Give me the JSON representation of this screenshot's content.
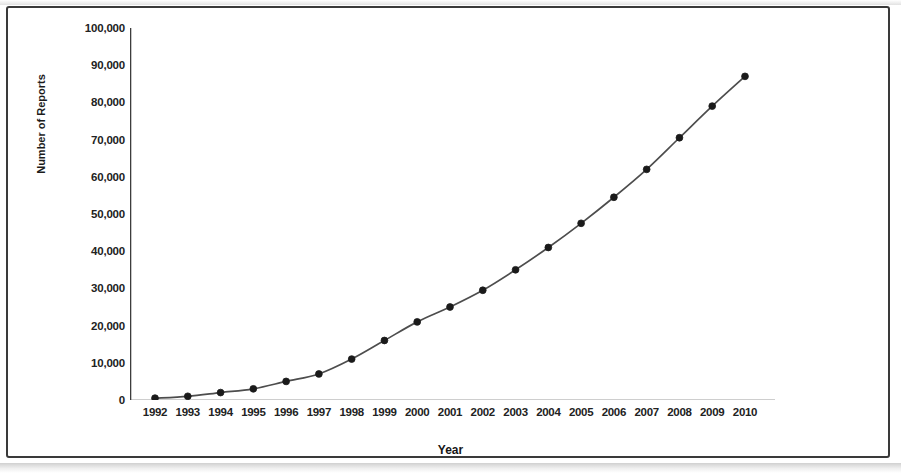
{
  "chart_data": {
    "type": "line",
    "title": "",
    "xlabel": "Year",
    "ylabel": "Number of Reports",
    "categories": [
      "1992",
      "1993",
      "1994",
      "1995",
      "1996",
      "1997",
      "1998",
      "1999",
      "2000",
      "2001",
      "2002",
      "2003",
      "2004",
      "2005",
      "2006",
      "2007",
      "2008",
      "2009",
      "2010"
    ],
    "values": [
      500,
      1000,
      2000,
      3000,
      5000,
      7000,
      11000,
      16000,
      21000,
      25000,
      29500,
      35000,
      41000,
      47500,
      54500,
      62000,
      70500,
      79000,
      87000
    ],
    "series": [
      {
        "name": "Number of Reports",
        "values": [
          500,
          1000,
          2000,
          3000,
          5000,
          7000,
          11000,
          16000,
          21000,
          25000,
          29500,
          35000,
          41000,
          47500,
          54500,
          62000,
          70500,
          79000,
          87000
        ]
      }
    ],
    "ylim": [
      0,
      100000
    ],
    "ytick_labels": [
      "100,000",
      "90,000",
      "80,000",
      "70,000",
      "60,000",
      "50,000",
      "40,000",
      "30,000",
      "20,000",
      "10,000",
      "0"
    ],
    "ytick_values": [
      100000,
      90000,
      80000,
      70000,
      60000,
      50000,
      40000,
      30000,
      20000,
      10000,
      0
    ],
    "y_minor_ticks": true,
    "grid": false,
    "legend": false,
    "legend_position": "none",
    "marker": "filled-circle",
    "marker_color": "#1a1a1a",
    "line_color": "#4d4d4d"
  },
  "colors": {
    "line": "#4d4d4d",
    "marker": "#1a1a1a",
    "axis": "#3d3d3d",
    "frame": "#3a3a3a",
    "text": "#1c1c1c",
    "background": "#ffffff"
  }
}
